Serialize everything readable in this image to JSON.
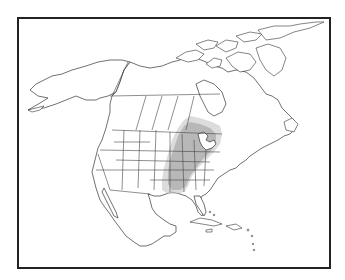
{
  "map": {
    "type": "outline-map",
    "region": "North America",
    "projection_hint": "conic",
    "frame": {
      "border_color": "#222222",
      "background": "#ffffff"
    },
    "colors": {
      "land_fill": "#ffffff",
      "outline": "#333333",
      "shaded_range_core": "#9a9a9a",
      "shaded_range_halo": "#c4c4c4"
    },
    "layers": [
      {
        "name": "coastlines",
        "visible": true
      },
      {
        "name": "state-province-boundaries",
        "visible": true
      },
      {
        "name": "shaded-range",
        "visible": true,
        "description": "Gray shaded area over eastern-central United States: Great Lakes region, Ohio and Mississippi valleys, south to the Gulf coast"
      }
    ],
    "labels": []
  }
}
